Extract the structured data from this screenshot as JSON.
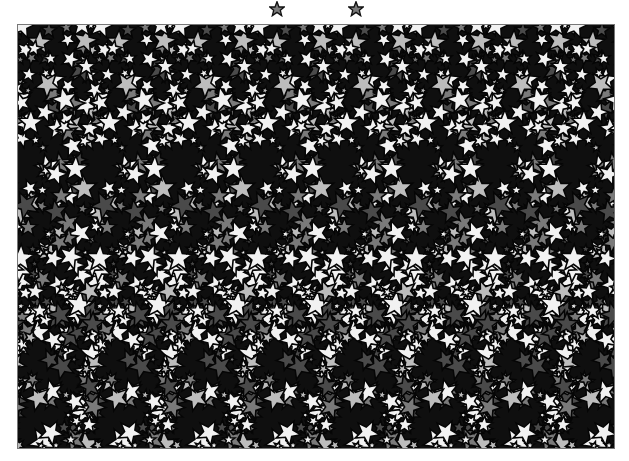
{
  "image": {
    "type": "autostereogram",
    "pattern": "stars",
    "repeat_period_px": 79,
    "colors": {
      "background": "#ffffff",
      "frame_border": "#777777",
      "dark": "#0a0a0a",
      "white_star": "#f2f2f2",
      "light_gray": "#bdbdbd",
      "mid_gray": "#7a7a7a",
      "dark_gray": "#4a4a4a"
    }
  },
  "guides": [
    {
      "icon": "star-icon",
      "x": 277
    },
    {
      "icon": "star-icon",
      "x": 356
    }
  ]
}
